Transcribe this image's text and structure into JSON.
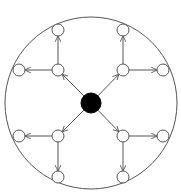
{
  "diagram": {
    "type": "radial-tree",
    "colors": {
      "stroke": "#555555",
      "hub_fill": "#000000",
      "node_fill": "#ffffff",
      "boundary": "#555555"
    },
    "boundary": {
      "cx": 91,
      "cy": 103,
      "r": 86
    },
    "hub": {
      "id": "hub",
      "cx": 91,
      "cy": 103,
      "r": 10
    },
    "inner_nodes": [
      {
        "id": "inner-top-left",
        "cx": 58,
        "cy": 70
      },
      {
        "id": "inner-top-right",
        "cx": 123,
        "cy": 70
      },
      {
        "id": "inner-bottom-left",
        "cx": 58,
        "cy": 136
      },
      {
        "id": "inner-bottom-right",
        "cx": 123,
        "cy": 136
      }
    ],
    "outer_nodes": [
      {
        "id": "outer-top-left-up",
        "cx": 58,
        "cy": 30,
        "parent": "inner-top-left"
      },
      {
        "id": "outer-top-left-left",
        "cx": 19,
        "cy": 70,
        "parent": "inner-top-left"
      },
      {
        "id": "outer-top-right-up",
        "cx": 123,
        "cy": 30,
        "parent": "inner-top-right"
      },
      {
        "id": "outer-top-right-right",
        "cx": 163,
        "cy": 70,
        "parent": "inner-top-right"
      },
      {
        "id": "outer-bottom-left-left",
        "cx": 19,
        "cy": 136,
        "parent": "inner-bottom-left"
      },
      {
        "id": "outer-bottom-left-down",
        "cx": 58,
        "cy": 177,
        "parent": "inner-bottom-left"
      },
      {
        "id": "outer-bottom-right-right",
        "cx": 163,
        "cy": 136,
        "parent": "inner-bottom-right"
      },
      {
        "id": "outer-bottom-right-down",
        "cx": 123,
        "cy": 177,
        "parent": "inner-bottom-right"
      }
    ],
    "node_radius": 6,
    "edges": [
      {
        "from": "hub",
        "to": "inner-top-left"
      },
      {
        "from": "hub",
        "to": "inner-top-right"
      },
      {
        "from": "hub",
        "to": "inner-bottom-left"
      },
      {
        "from": "hub",
        "to": "inner-bottom-right"
      },
      {
        "from": "inner-top-left",
        "to": "outer-top-left-up"
      },
      {
        "from": "inner-top-left",
        "to": "outer-top-left-left"
      },
      {
        "from": "inner-top-right",
        "to": "outer-top-right-up"
      },
      {
        "from": "inner-top-right",
        "to": "outer-top-right-right"
      },
      {
        "from": "inner-bottom-left",
        "to": "outer-bottom-left-left"
      },
      {
        "from": "inner-bottom-left",
        "to": "outer-bottom-left-down"
      },
      {
        "from": "inner-bottom-right",
        "to": "outer-bottom-right-right"
      },
      {
        "from": "inner-bottom-right",
        "to": "outer-bottom-right-down"
      }
    ]
  }
}
